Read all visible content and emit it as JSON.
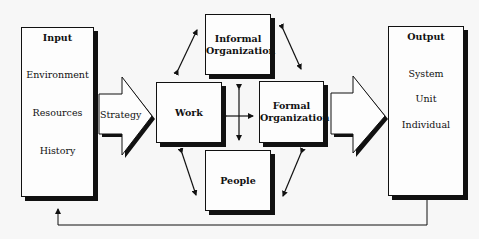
{
  "diagram": {
    "input": {
      "title": "Input",
      "items": [
        "Environment",
        "Resources",
        "History"
      ]
    },
    "strategy_arrow": {
      "label": "Strategy"
    },
    "components": {
      "work": "Work",
      "informal_organization": [
        "Informal",
        "Organization"
      ],
      "formal_organization": [
        "Formal",
        "Organization"
      ],
      "people": "People"
    },
    "output": {
      "title": "Output",
      "items": [
        "System",
        "Unit",
        "Individual"
      ]
    },
    "connections": [
      {
        "from": "Work",
        "to": "Informal Organization",
        "type": "bidirectional"
      },
      {
        "from": "Informal Organization",
        "to": "Formal Organization",
        "type": "bidirectional"
      },
      {
        "from": "Work",
        "to": "People",
        "type": "bidirectional"
      },
      {
        "from": "People",
        "to": "Formal Organization",
        "type": "bidirectional"
      },
      {
        "from": "Work",
        "to": "Formal Organization",
        "type": "bidirectional"
      },
      {
        "from": "Informal Organization",
        "to": "People",
        "type": "bidirectional"
      },
      {
        "from": "Input",
        "to": "Work",
        "type": "arrow",
        "label": "Strategy"
      },
      {
        "from": "Formal Organization",
        "to": "Output",
        "type": "arrow"
      },
      {
        "from": "Output",
        "to": "Input",
        "type": "feedback"
      }
    ]
  }
}
